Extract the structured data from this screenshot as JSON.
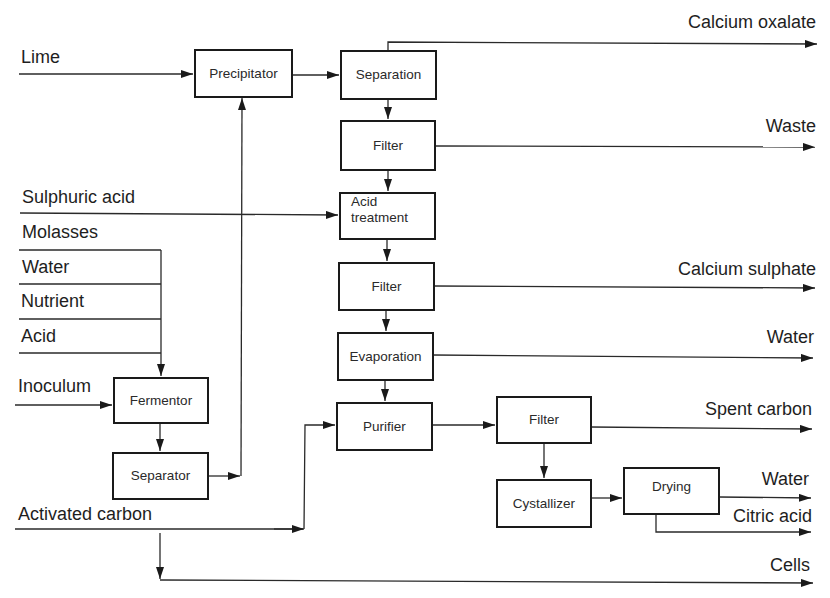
{
  "diagram": {
    "type": "process-flow"
  },
  "inputs": {
    "lime": "Lime",
    "sulphuric_acid": "Sulphuric acid",
    "molasses": "Molasses",
    "water": "Water",
    "nutrient": "Nutrient",
    "acid": "Acid",
    "inoculum": "Inoculum",
    "activated_carbon": "Activated carbon"
  },
  "units": {
    "precipitator": "Precipitator",
    "separation": "Separation",
    "filter_1": "Filter",
    "acid_treatment_line1": "Acid",
    "acid_treatment_line2": "treatment",
    "filter_2": "Filter",
    "evaporation": "Evaporation",
    "purifier": "Purifier",
    "fermentor": "Fermentor",
    "separator": "Separator",
    "filter_3": "Filter",
    "crystallizer": "Cystallizer",
    "drying": "Drying"
  },
  "outputs": {
    "calcium_oxalate": "Calcium oxalate",
    "waste": "Waste",
    "calcium_sulphate": "Calcium sulphate",
    "water_evap": "Water",
    "spent_carbon": "Spent carbon",
    "water_drying": "Water",
    "citric_acid": "Citric acid",
    "cells": "Cells"
  },
  "edges": [
    [
      "Lime",
      "Precipitator"
    ],
    [
      "Precipitator",
      "Separation"
    ],
    [
      "Separation",
      "Calcium oxalate"
    ],
    [
      "Separation",
      "Filter"
    ],
    [
      "Filter",
      "Waste"
    ],
    [
      "Filter",
      "Acid treatment"
    ],
    [
      "Sulphuric acid",
      "Acid treatment"
    ],
    [
      "Acid treatment",
      "Filter"
    ],
    [
      "Filter",
      "Calcium sulphate"
    ],
    [
      "Filter",
      "Evaporation"
    ],
    [
      "Evaporation",
      "Water"
    ],
    [
      "Evaporation",
      "Purifier"
    ],
    [
      "Activated carbon",
      "Purifier"
    ],
    [
      "Purifier",
      "Filter"
    ],
    [
      "Filter",
      "Spent carbon"
    ],
    [
      "Filter",
      "Cystallizer"
    ],
    [
      "Cystallizer",
      "Drying"
    ],
    [
      "Drying",
      "Water"
    ],
    [
      "Drying",
      "Citric acid"
    ],
    [
      "Molasses",
      "Fermentor"
    ],
    [
      "Water",
      "Fermentor"
    ],
    [
      "Nutrient",
      "Fermentor"
    ],
    [
      "Acid",
      "Fermentor"
    ],
    [
      "Inoculum",
      "Fermentor"
    ],
    [
      "Fermentor",
      "Separator"
    ],
    [
      "Separator",
      "Precipitator"
    ],
    [
      "Separator",
      "Cells"
    ]
  ]
}
